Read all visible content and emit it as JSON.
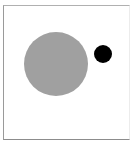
{
  "diagram": {
    "frame": {
      "border_color": "#9a9a9a",
      "background": "#ffffff"
    },
    "shapes": [
      {
        "id": "large-circle",
        "type": "circle",
        "cx": 56,
        "cy": 64,
        "r": 32,
        "fill": "#a0a0a0"
      },
      {
        "id": "small-circle",
        "type": "circle",
        "cx": 103,
        "cy": 54,
        "r": 9,
        "fill": "#000000"
      }
    ]
  }
}
